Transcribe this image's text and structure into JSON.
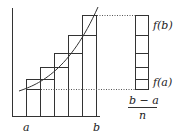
{
  "diagram": {
    "labels": {
      "a": "a",
      "b": "b",
      "fa": "f(a)",
      "fb": "f(b)",
      "width_num": "b − a",
      "width_den": "n"
    },
    "colors": {
      "line": "#333333",
      "dotted": "#555555",
      "background": "#ffffff"
    },
    "rectangles": [
      {
        "x": 26,
        "top": 79
      },
      {
        "x": 40,
        "top": 67
      },
      {
        "x": 54,
        "top": 53
      },
      {
        "x": 68,
        "top": 35
      },
      {
        "x": 82,
        "top": 15
      }
    ],
    "stack_dividers": [
      15,
      35,
      53,
      67,
      79,
      89
    ]
  }
}
